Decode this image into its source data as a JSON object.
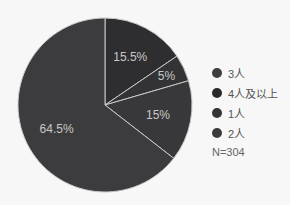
{
  "chart_data": {
    "type": "pie",
    "title": "",
    "categories": [
      "3人",
      "4人及以上",
      "1人",
      "2人"
    ],
    "values": [
      15.5,
      5,
      15,
      64.5
    ],
    "value_labels": [
      "15.5%",
      "5%",
      "15%",
      "64.5%"
    ],
    "colors": [
      "#2e2e30",
      "#333336",
      "#38383a",
      "#3c3c3e"
    ],
    "start_angle_deg": 0,
    "direction": "clockwise",
    "legend_position": "right",
    "note": "N=304"
  },
  "legend": {
    "items": [
      {
        "label": "3人",
        "color": "#3e3e40"
      },
      {
        "label": "4人及以上",
        "color": "#2a2a2c"
      },
      {
        "label": "1人",
        "color": "#343436"
      },
      {
        "label": "2人",
        "color": "#3a3a3c"
      }
    ],
    "n_label": "N=304"
  }
}
